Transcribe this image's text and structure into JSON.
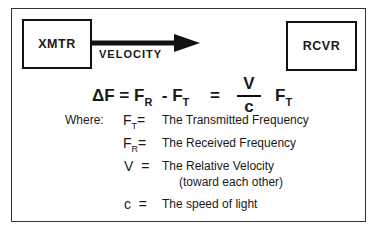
{
  "diagram": {
    "transmitter_label": "XMTR",
    "receiver_label": "RCVR",
    "arrow_label": "VELOCITY",
    "equation": {
      "lhs": "ΔF",
      "eq1": "=",
      "term1": "F",
      "term1_sub": "R",
      "minus": "-",
      "term2": "F",
      "term2_sub": "T",
      "eq2": "=",
      "numerator": "V",
      "denominator": "c",
      "term3": "F",
      "term3_sub": "T"
    },
    "where_label": "Where:",
    "definitions": [
      {
        "symbol": "F",
        "sub": "T",
        "eq": "=",
        "text": "The Transmitted Frequency"
      },
      {
        "symbol": "F",
        "sub": "R",
        "eq": "=",
        "text": "The Received Frequency"
      },
      {
        "symbol": "V",
        "sub": "",
        "eq": "=",
        "text": "The Relative Velocity",
        "note": "(toward each other)"
      },
      {
        "symbol": "c",
        "sub": "",
        "eq": "=",
        "text": "The speed of light"
      }
    ]
  }
}
